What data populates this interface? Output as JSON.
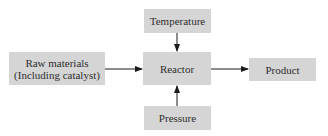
{
  "diagram": {
    "type": "process-flow",
    "nodes": {
      "temperature": {
        "label": "Temperature"
      },
      "reactor": {
        "label": "Reactor"
      },
      "raw_materials": {
        "line1": "Raw materials",
        "line2": "(Including catalyst)"
      },
      "product": {
        "label": "Product"
      },
      "pressure": {
        "label": "Pressure"
      }
    },
    "edges": [
      {
        "from": "raw_materials",
        "to": "reactor"
      },
      {
        "from": "reactor",
        "to": "product"
      },
      {
        "from": "temperature",
        "to": "reactor"
      },
      {
        "from": "pressure",
        "to": "reactor"
      }
    ],
    "colors": {
      "box_fill": "#d5d5d5",
      "text": "#2e2e2e",
      "arrow": "#1a1a1a"
    }
  }
}
